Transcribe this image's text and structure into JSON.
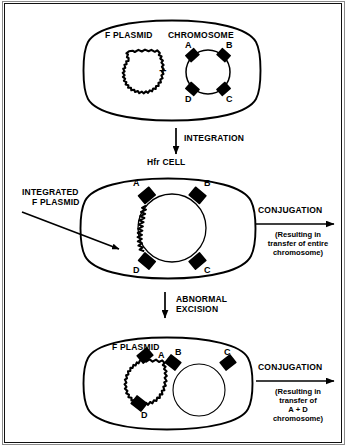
{
  "figure": {
    "background": "#ffffff",
    "ink": "#000000"
  },
  "top_cell": {
    "name": "donor-cell",
    "labels": {
      "f_plasmid": "F PLASMID",
      "chromosome": "CHROMOSOME",
      "plus": "+"
    },
    "genes": [
      "A",
      "B",
      "C",
      "D"
    ]
  },
  "step_integration": {
    "label": "INTEGRATION",
    "result_label": "Hfr CELL"
  },
  "middle_cell": {
    "name": "hfr-cell",
    "callout": {
      "line1": "INTEGRATED",
      "line2": "F PLASMID"
    },
    "genes": [
      "A",
      "B",
      "C",
      "D"
    ]
  },
  "conjugation_top": {
    "heading": "CONJUGATION",
    "note_lines": [
      "(Resulting in",
      "transfer of entire",
      "chromosome)"
    ]
  },
  "step_excision": {
    "line1": "ABNORMAL",
    "line2": "EXCISION"
  },
  "bottom_cell": {
    "name": "fprime-cell",
    "labels": {
      "f_plasmid": "F PLASMID"
    },
    "plasmid_genes": [
      "A",
      "D"
    ],
    "chromosome_genes": [
      "B",
      "C"
    ]
  },
  "conjugation_bottom": {
    "heading": "CONJUGATION",
    "note_lines": [
      "(Resulting in",
      "transfer of",
      "A + D",
      "chromosome)"
    ]
  }
}
